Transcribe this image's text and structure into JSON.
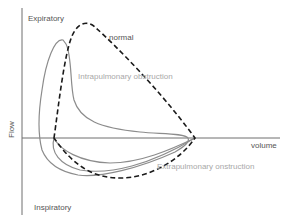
{
  "diagram": {
    "axes": {
      "y_label": "Flow",
      "top_label": "Expiratory",
      "bottom_label": "Inspiratory",
      "x_label": "volume"
    },
    "curves": [
      {
        "name": "normal",
        "label": "normal",
        "style": "dashed",
        "color": "#1a1a1a"
      },
      {
        "name": "intrapulmonary",
        "label": "Intrapulmonary obstruction",
        "style": "solid",
        "color": "#8c8c8c"
      },
      {
        "name": "extrapulmonary",
        "label": "Extrapulmonary onstruction",
        "style": "solid",
        "color": "#8c8c8c"
      }
    ],
    "colors": {
      "axis": "#6e6e6e",
      "label_dark": "#555555",
      "label_light": "#a8a8a8"
    }
  }
}
